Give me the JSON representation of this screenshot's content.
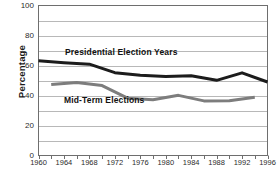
{
  "chart_data": {
    "type": "line",
    "title": "",
    "subtitle": "",
    "xlabel": "",
    "ylabel": "Percentage",
    "xlim": [
      1960,
      1996
    ],
    "ylim": [
      0,
      100
    ],
    "grid": true,
    "legend_position": "inline-annotation",
    "y_ticks": [
      0,
      20,
      40,
      60,
      80,
      100
    ],
    "y_tick_labels": [
      "0",
      "20",
      "40",
      "60",
      "80",
      "100"
    ],
    "y_minor_ticks": [
      10,
      30,
      50,
      70,
      90
    ],
    "x_ticks": [
      1960,
      1962,
      1964,
      1966,
      1968,
      1970,
      1972,
      1974,
      1976,
      1978,
      1980,
      1982,
      1984,
      1986,
      1988,
      1990,
      1992,
      1994,
      1996
    ],
    "x_tick_labels": [
      "1960",
      "1964",
      "1968",
      "1972",
      "1976",
      "1980",
      "1984",
      "1988",
      "1992",
      "1996"
    ],
    "x_labeled_ticks": [
      1960,
      1964,
      1968,
      1972,
      1976,
      1980,
      1984,
      1988,
      1992,
      1996
    ],
    "series": [
      {
        "name": "Presidential Election Years",
        "color": "#1c1c1c",
        "line_width": 3,
        "x": [
          1960,
          1964,
          1968,
          1972,
          1976,
          1980,
          1984,
          1988,
          1992,
          1996
        ],
        "values": [
          63.1,
          61.9,
          60.9,
          55.2,
          53.5,
          52.6,
          53.1,
          50.1,
          55.1,
          49.0
        ]
      },
      {
        "name": "Mid-Term Elections",
        "color": "#7d7d7d",
        "line_width": 3,
        "x": [
          1962,
          1966,
          1970,
          1974,
          1978,
          1982,
          1986,
          1990,
          1994
        ],
        "values": [
          47.3,
          48.7,
          46.6,
          38.2,
          37.2,
          40.1,
          36.4,
          36.5,
          38.8
        ]
      }
    ],
    "annotations": [
      {
        "text": "Presidential Election Years",
        "series": "Presidential Election Years"
      },
      {
        "text": "Mid-Term Elections",
        "series": "Mid-Term Elections"
      }
    ]
  },
  "axis_title": {
    "y": "Percentage"
  },
  "colors": {
    "presidential": "#1c1c1c",
    "midterm": "#7d7d7d",
    "grid": "#b8b8b8",
    "frame": "#6e6e6e",
    "text": "#2b2b2b"
  }
}
